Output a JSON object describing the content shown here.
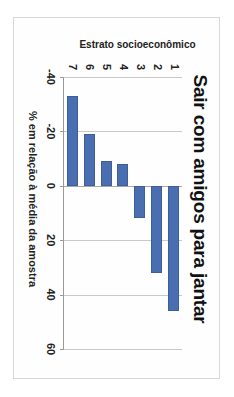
{
  "chart_data": {
    "type": "bar",
    "orientation": "vertical",
    "title": "Sair com amigos para jantar",
    "xlabel": "Estrato socioeconômico",
    "ylabel": "% em relação à média da amostra",
    "categories": [
      "1",
      "2",
      "3",
      "4",
      "5",
      "6",
      "7"
    ],
    "values": [
      46,
      32,
      12,
      -8,
      -9,
      -19,
      -33
    ],
    "ylim": [
      -40,
      60
    ],
    "yticks": [
      "60",
      "40",
      "20",
      "0",
      "-20",
      "-40"
    ],
    "ytick_values": [
      60,
      40,
      20,
      0,
      -20,
      -40
    ],
    "grid": true,
    "legend": false,
    "series_color": "#4a6fb1",
    "gridline_color": "#c9c9c9",
    "axis_color": "#9a9a9a",
    "bar_border_color": "#3c5e9c"
  }
}
